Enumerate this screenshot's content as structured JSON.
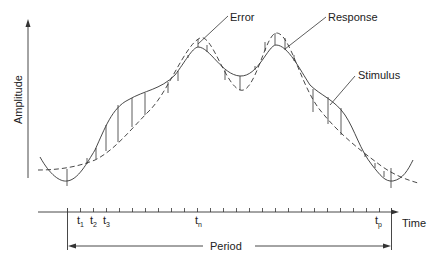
{
  "diagram": {
    "type": "signal-error-diagram",
    "y_axis": {
      "label": "Amplitude"
    },
    "x_axis": {
      "label": "Time"
    },
    "curves": [
      {
        "name": "Stimulus",
        "style": "solid"
      },
      {
        "name": "Response",
        "style": "dashed"
      }
    ],
    "annotations": {
      "error": "Error",
      "response": "Response",
      "stimulus": "Stimulus"
    },
    "ticks": {
      "t1": {
        "main": "t",
        "sub": "1"
      },
      "t2": {
        "main": "t",
        "sub": "2"
      },
      "t3": {
        "main": "t",
        "sub": "3"
      },
      "tn": {
        "main": "t",
        "sub": "n"
      },
      "tp": {
        "main": "t",
        "sub": "p"
      }
    },
    "period": {
      "label": "Period"
    }
  }
}
